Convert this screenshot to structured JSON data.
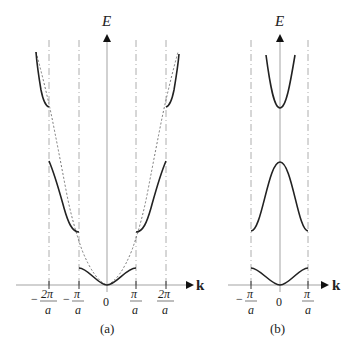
{
  "figure": {
    "panels": [
      {
        "id": "a",
        "caption": "(a)",
        "y_axis_label": "E",
        "x_axis_label": "k",
        "tick_labels": [
          {
            "sign": "−",
            "num": "2π",
            "den": "a"
          },
          {
            "sign": "−",
            "num": "π",
            "den": "a"
          },
          {
            "sign": "",
            "num": "0",
            "den": ""
          },
          {
            "sign": "",
            "num": "π",
            "den": "a"
          },
          {
            "sign": "",
            "num": "2π",
            "den": "a"
          }
        ],
        "description": "Extended zone scheme: energy bands with gaps at k = ±π/a and ±2π/a; dashed free-electron parabola"
      },
      {
        "id": "b",
        "caption": "(b)",
        "y_axis_label": "E",
        "x_axis_label": "k",
        "tick_labels": [
          {
            "sign": "−",
            "num": "π",
            "den": "a"
          },
          {
            "sign": "",
            "num": "0",
            "den": ""
          },
          {
            "sign": "",
            "num": "π",
            "den": "a"
          }
        ],
        "description": "Reduced zone scheme: three bands folded into first Brillouin zone"
      }
    ],
    "colors": {
      "curve": "#222222",
      "axis": "#999999",
      "dashed": "#888888"
    }
  }
}
